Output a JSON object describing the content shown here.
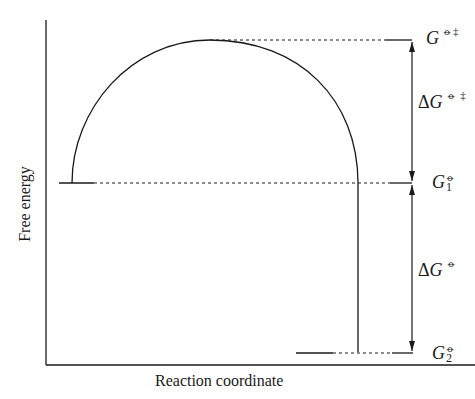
{
  "diagram": {
    "type": "free-energy-reaction-profile",
    "axes": {
      "x_label": "Reaction coordinate",
      "y_label": "Free energy"
    },
    "levels": {
      "transition_state": {
        "symbol": "G",
        "superscript": "⦵‡"
      },
      "initial": {
        "symbol": "G",
        "subscript": "1",
        "superscript": "⦵"
      },
      "final": {
        "symbol": "G",
        "subscript": "2",
        "superscript": "⦵"
      }
    },
    "differences": {
      "activation": {
        "symbol": "ΔG",
        "superscript": "⦵ ‡"
      },
      "reaction": {
        "symbol": "ΔG",
        "superscript": "⦵"
      }
    },
    "colors": {
      "line": "#1a1a1a",
      "background": "#ffffff"
    }
  }
}
